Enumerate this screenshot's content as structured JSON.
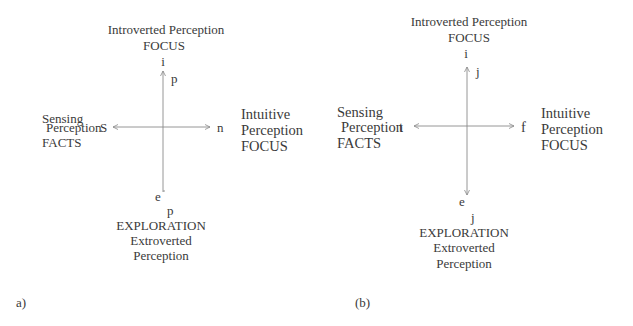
{
  "panels": [
    {
      "id": "a",
      "caption": "a)",
      "top": {
        "line1": "Introverted Perception",
        "line2": "FOCUS",
        "pole": "i",
        "axis_letter": "p"
      },
      "left": {
        "line1": "Sensing",
        "line2": "Perception",
        "line3": "FACTS",
        "pole": "S"
      },
      "right": {
        "line1": "Intuitive",
        "line2": "Perception",
        "line3": "FOCUS",
        "pole": "n"
      },
      "bottom": {
        "pole": "e",
        "axis_letter": "p",
        "line1": "EXPLORATION",
        "line2": "Extroverted",
        "line3": "Perception"
      }
    },
    {
      "id": "b",
      "caption": "(b)",
      "top": {
        "line1": "Introverted Perception",
        "line2": "FOCUS",
        "pole": "i",
        "axis_letter": "j"
      },
      "left": {
        "line1": "Sensing",
        "line2": "Perception",
        "line3": "FACTS",
        "pole": "t"
      },
      "right": {
        "line1": "Intuitive",
        "line2": "Perception",
        "line3": "FOCUS",
        "pole": "f"
      },
      "bottom": {
        "pole": "e",
        "axis_letter": "j",
        "line1": "EXPLORATION",
        "line2": "Extroverted",
        "line3": "Perception"
      }
    }
  ],
  "colors": {
    "axis": "#8a8a8a",
    "text": "#3a3a3a",
    "background": "#ffffff"
  }
}
